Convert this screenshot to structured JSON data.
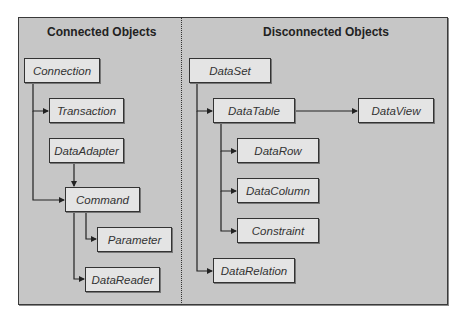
{
  "diagram": {
    "sections": [
      {
        "id": "connected",
        "title": "Connected Objects"
      },
      {
        "id": "disconnected",
        "title": "Disconnected Objects"
      }
    ],
    "nodes": {
      "connection": "Connection",
      "transaction": "Transaction",
      "data_adapter": "DataAdapter",
      "command": "Command",
      "parameter": "Parameter",
      "data_reader": "DataReader",
      "data_set": "DataSet",
      "data_table": "DataTable",
      "data_view": "DataView",
      "data_row": "DataRow",
      "data_column": "DataColumn",
      "constraint": "Constraint",
      "data_relation": "DataRelation"
    },
    "edges": [
      {
        "from": "Connection",
        "to": "Transaction"
      },
      {
        "from": "Connection",
        "to": "Command"
      },
      {
        "from": "DataAdapter",
        "to": "Command"
      },
      {
        "from": "Command",
        "to": "Parameter"
      },
      {
        "from": "Command",
        "to": "DataReader"
      },
      {
        "from": "DataSet",
        "to": "DataTable"
      },
      {
        "from": "DataSet",
        "to": "DataRelation"
      },
      {
        "from": "DataTable",
        "to": "DataView"
      },
      {
        "from": "DataTable",
        "to": "DataRow"
      },
      {
        "from": "DataTable",
        "to": "DataColumn"
      },
      {
        "from": "DataTable",
        "to": "Constraint"
      }
    ],
    "colors": {
      "background": "#c6c6c6",
      "node_fill": "#e4e4e4",
      "border": "#333333"
    }
  }
}
